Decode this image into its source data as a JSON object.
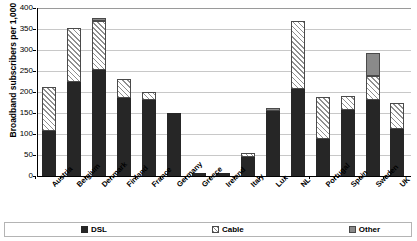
{
  "chart_data": {
    "type": "bar",
    "title": "",
    "subtitle": "",
    "xlabel": "",
    "ylabel": "Broadband subscribers per 1,000 households",
    "ylim": [
      0,
      400
    ],
    "ytick_step": 50,
    "yticks": [
      400,
      350,
      300,
      250,
      200,
      150,
      100,
      50,
      0
    ],
    "ytick_labels": [
      "400",
      "350",
      "300",
      "250",
      "200",
      "150",
      "100",
      "50",
      "0"
    ],
    "grid": true,
    "stacked": true,
    "legend_position": "bottom",
    "categories": [
      "Austria",
      "Belgium",
      "Denmark",
      "Finland",
      "France",
      "Germany",
      "Greece",
      "Ireland",
      "Italy",
      "Lux",
      "NL",
      "Portugal",
      "Spain",
      "Sweden",
      "UK"
    ],
    "series": [
      {
        "name": "DSL",
        "color": "#262626",
        "pattern": "solid",
        "values": [
          107,
          224,
          252,
          186,
          181,
          150,
          6,
          6,
          45,
          155,
          208,
          87,
          157,
          182,
          113
        ]
      },
      {
        "name": "Cable",
        "color": "#ffffff",
        "pattern": "diagonal-hatch",
        "values": [
          105,
          129,
          118,
          46,
          19,
          0,
          0,
          0,
          10,
          0,
          160,
          101,
          33,
          56,
          62
        ]
      },
      {
        "name": "Other",
        "color": "#8a8a8a",
        "pattern": "solid-gray",
        "values": [
          0,
          0,
          7,
          0,
          0,
          0,
          0,
          0,
          0,
          8,
          0,
          0,
          0,
          56,
          0
        ]
      }
    ],
    "totals": [
      212,
      353,
      377,
      232,
      200,
      150,
      6,
      6,
      55,
      163,
      368,
      188,
      190,
      294,
      175
    ]
  },
  "legend": {
    "items": [
      {
        "label": "DSL",
        "swatch": "dsl-swatch-icon"
      },
      {
        "label": "Cable",
        "swatch": "cable-swatch-icon"
      },
      {
        "label": "Other",
        "swatch": "other-swatch-icon"
      }
    ]
  }
}
